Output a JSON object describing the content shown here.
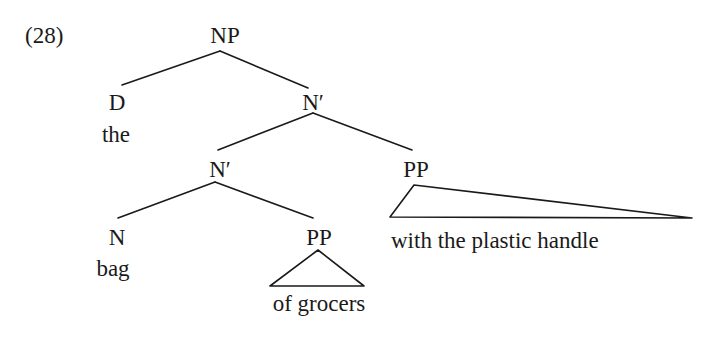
{
  "example_number": "(28)",
  "tree": {
    "root": {
      "label": "NP",
      "children": [
        {
          "label": "D",
          "word": "the"
        },
        {
          "label": "N′",
          "children": [
            {
              "label": "N′",
              "children": [
                {
                  "label": "N",
                  "word": "bag"
                },
                {
                  "label": "PP",
                  "triangle": true,
                  "word": "of grocers"
                }
              ]
            },
            {
              "label": "PP",
              "triangle": true,
              "word": "with the plastic handle"
            }
          ]
        }
      ]
    }
  },
  "labels": {
    "np": "NP",
    "d": "D",
    "the": "the",
    "nbar_top": "N′",
    "nbar_lower": "N′",
    "pp_right": "PP",
    "n": "N",
    "bag": "bag",
    "pp_lower": "PP",
    "of_grocers": "of grocers",
    "with_the_plastic_handle": "with the plastic handle"
  }
}
